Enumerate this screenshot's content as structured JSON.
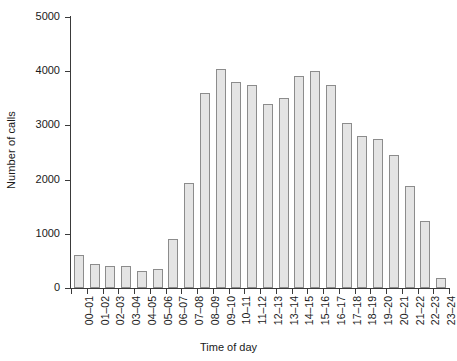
{
  "chart_data": {
    "type": "bar",
    "title": "",
    "xlabel": "Time of day",
    "ylabel": "Number of calls",
    "categories": [
      "00–01",
      "01–02",
      "02–03",
      "03–04",
      "04–05",
      "05–06",
      "06–07",
      "07–08",
      "08–09",
      "09–10",
      "10–11",
      "11–12",
      "12–13",
      "13–14",
      "14–15",
      "15–16",
      "16–17",
      "17–18",
      "18–19",
      "19–20",
      "20–21",
      "21–22",
      "22–23",
      "23–24"
    ],
    "values": [
      600,
      450,
      400,
      400,
      310,
      360,
      910,
      1930,
      3600,
      4050,
      3800,
      3750,
      3400,
      3500,
      3920,
      4000,
      3750,
      3050,
      2800,
      2750,
      2450,
      1880,
      1230,
      190
    ],
    "ylim": [
      0,
      5000
    ],
    "y_ticks": [
      0,
      1000,
      2000,
      3000,
      4000,
      5000
    ],
    "y_tick_labels": [
      "0",
      "1000",
      "2000",
      "3000",
      "4000",
      "5000"
    ],
    "grid": false,
    "legend": null,
    "bar_fill_color": "#e4e4e4",
    "bar_edge_color": "#8c8c8c",
    "axis_color": "#3a3a3a"
  }
}
